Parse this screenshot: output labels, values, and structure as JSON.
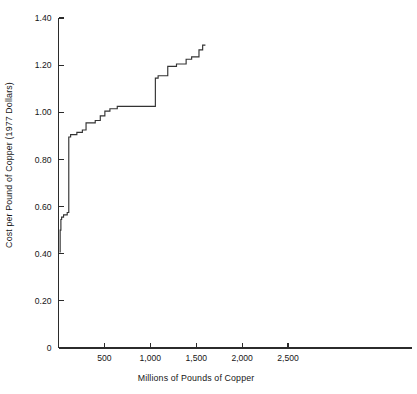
{
  "chart_data": {
    "type": "line",
    "subtype": "step",
    "title": "",
    "xlabel": "Millions of Pounds of Copper",
    "ylabel": "Cost per Pound of Copper (1977 Dollars)",
    "xlim": [
      0,
      3850
    ],
    "ylim": [
      0,
      1.4
    ],
    "grid": false,
    "legend": null,
    "xticks": [
      500,
      1000,
      1500,
      2000,
      2500
    ],
    "xtick_labels": [
      "500",
      "1,000",
      "1,500",
      "2,000",
      "2,500"
    ],
    "yticks": [
      0,
      0.2,
      0.4,
      0.6,
      0.8,
      1.0,
      1.2,
      1.4
    ],
    "ytick_labels": [
      "0",
      "0.20",
      "0.40",
      "0.60",
      "0.80",
      "1.00",
      "1.20",
      "1.40"
    ],
    "series": [
      {
        "name": "Copper supply curve",
        "color": "#333333",
        "x": [
          18,
          18,
          26,
          26,
          34,
          34,
          55,
          55,
          95,
          95,
          112,
          112,
          132,
          132,
          200,
          200,
          260,
          260,
          300,
          300,
          400,
          400,
          455,
          455,
          505,
          505,
          560,
          560,
          640,
          640,
          1055,
          1055,
          1085,
          1085,
          1190,
          1190,
          1285,
          1285,
          1390,
          1390,
          1450,
          1450,
          1530,
          1530,
          1570,
          1570,
          1600
        ],
        "y": [
          0.405,
          0.5,
          0.5,
          0.545,
          0.545,
          0.555,
          0.555,
          0.565,
          0.565,
          0.575,
          0.575,
          0.895,
          0.895,
          0.905,
          0.905,
          0.915,
          0.915,
          0.925,
          0.925,
          0.955,
          0.955,
          0.965,
          0.965,
          0.985,
          0.985,
          1.005,
          1.005,
          1.015,
          1.015,
          1.025,
          1.025,
          1.145,
          1.145,
          1.155,
          1.155,
          1.195,
          1.195,
          1.205,
          1.205,
          1.225,
          1.225,
          1.235,
          1.235,
          1.265,
          1.265,
          1.285,
          1.285
        ]
      }
    ]
  },
  "axes": {
    "x_title": "Millions of Pounds of Copper",
    "y_title": "Cost per Pound of Copper (1977 Dollars)"
  }
}
